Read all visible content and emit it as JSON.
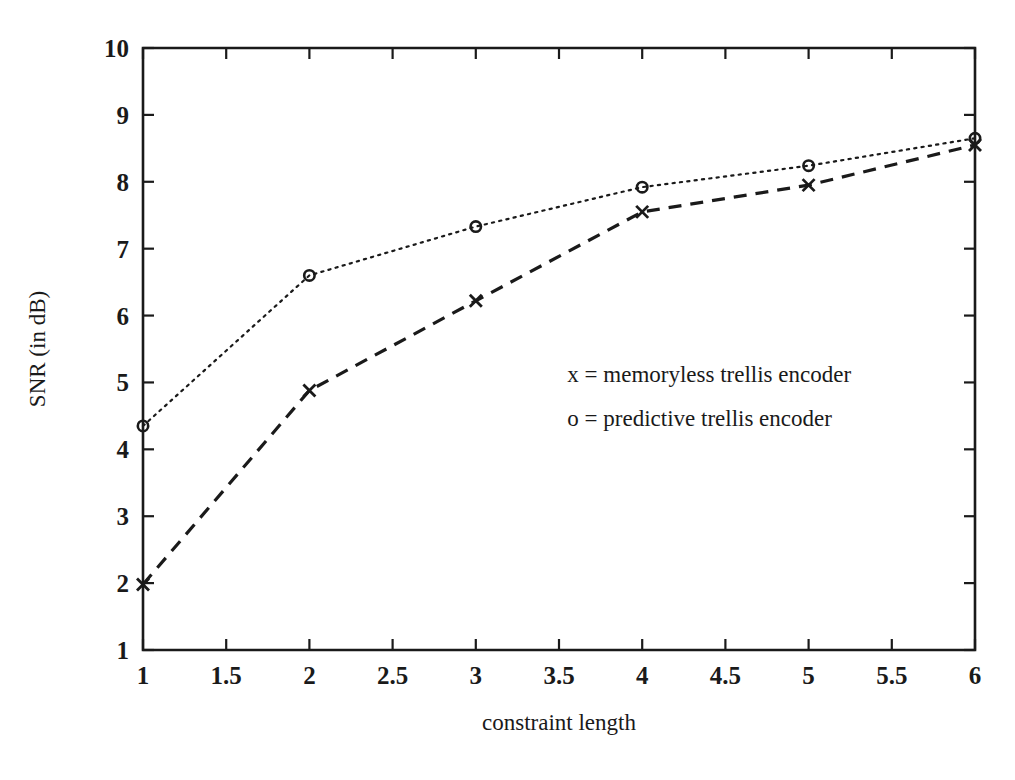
{
  "chart_data": {
    "type": "line",
    "title": "",
    "xlabel": "constraint length",
    "ylabel": "SNR (in dB)",
    "xlim": [
      1,
      6
    ],
    "ylim": [
      1,
      10
    ],
    "grid": false,
    "legend_position": "inside-center-right",
    "x": [
      1,
      2,
      3,
      4,
      5,
      6
    ],
    "xticks": [
      "1",
      "1.5",
      "2",
      "2.5",
      "3",
      "3.5",
      "4",
      "4.5",
      "5",
      "5.5",
      "6"
    ],
    "xtick_values": [
      1,
      1.5,
      2,
      2.5,
      3,
      3.5,
      4,
      4.5,
      5,
      5.5,
      6
    ],
    "yticks": [
      "1",
      "2",
      "3",
      "4",
      "5",
      "6",
      "7",
      "8",
      "9",
      "10"
    ],
    "ytick_values": [
      1,
      2,
      3,
      4,
      5,
      6,
      7,
      8,
      9,
      10
    ],
    "series": [
      {
        "name": "predictive trellis encoder",
        "marker": "o",
        "linestyle": "dotted",
        "color": "#1a1a1a",
        "values": [
          4.35,
          6.6,
          7.33,
          7.92,
          8.24,
          8.65
        ]
      },
      {
        "name": "memoryless trellis encoder",
        "marker": "x",
        "linestyle": "dashed",
        "color": "#1a1a1a",
        "values": [
          1.98,
          4.88,
          6.22,
          7.55,
          7.95,
          8.55
        ]
      }
    ],
    "annotations": [
      {
        "id": "legend-memoryless",
        "text": "x = memoryless trellis encoder",
        "x": 3.55,
        "y": 5.0
      },
      {
        "id": "legend-predictive",
        "text": "o = predictive trellis encoder",
        "x": 3.55,
        "y": 4.35
      }
    ]
  }
}
